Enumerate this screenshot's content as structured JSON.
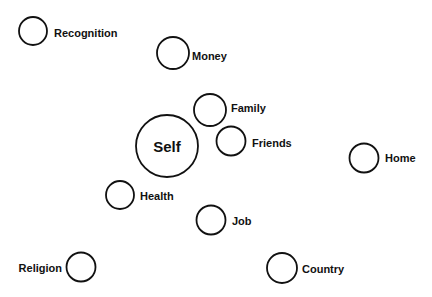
{
  "diagram": {
    "nodes": [
      {
        "id": "recognition",
        "label": "Recognition",
        "cx": 33,
        "cy": 31,
        "r": 14,
        "lx": 54,
        "ly": 37,
        "anchor": "start"
      },
      {
        "id": "money",
        "label": "Money",
        "cx": 173,
        "cy": 53,
        "r": 16,
        "lx": 192,
        "ly": 60,
        "anchor": "start"
      },
      {
        "id": "family",
        "label": "Family",
        "cx": 210,
        "cy": 110,
        "r": 16,
        "lx": 231,
        "ly": 112,
        "anchor": "start"
      },
      {
        "id": "self",
        "label": "Self",
        "cx": 167,
        "cy": 146,
        "r": 31,
        "lx": 167,
        "ly": 152,
        "anchor": "middle"
      },
      {
        "id": "friends",
        "label": "Friends",
        "cx": 231,
        "cy": 141,
        "r": 14.5,
        "lx": 252,
        "ly": 147,
        "anchor": "start"
      },
      {
        "id": "home",
        "label": "Home",
        "cx": 364,
        "cy": 158,
        "r": 14.5,
        "lx": 385,
        "ly": 162,
        "anchor": "start"
      },
      {
        "id": "health",
        "label": "Health",
        "cx": 120,
        "cy": 195,
        "r": 14,
        "lx": 140,
        "ly": 200,
        "anchor": "start"
      },
      {
        "id": "job",
        "label": "Job",
        "cx": 211,
        "cy": 220,
        "r": 14.5,
        "lx": 232,
        "ly": 225,
        "anchor": "start"
      },
      {
        "id": "religion",
        "label": "Religion",
        "cx": 81,
        "cy": 267,
        "r": 14.5,
        "lx": 62,
        "ly": 272,
        "anchor": "end"
      },
      {
        "id": "country",
        "label": "Country",
        "cx": 282,
        "cy": 268,
        "r": 15,
        "lx": 302,
        "ly": 273,
        "anchor": "start"
      }
    ]
  }
}
